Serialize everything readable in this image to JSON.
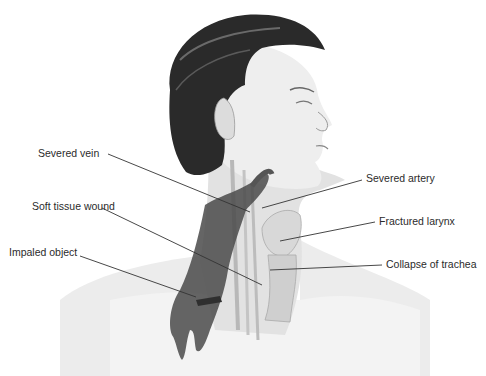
{
  "figure": {
    "labels": [
      {
        "id": "severed-vein",
        "text": "Severed vein",
        "x": 38,
        "y": 147
      },
      {
        "id": "soft-tissue-wound",
        "text": "Soft tissue wound",
        "x": 32,
        "y": 200
      },
      {
        "id": "impaled-object",
        "text": "Impaled object",
        "x": 9,
        "y": 246
      },
      {
        "id": "severed-artery",
        "text": "Severed artery",
        "x": 366,
        "y": 172
      },
      {
        "id": "fractured-larynx",
        "text": "Fractured larynx",
        "x": 379,
        "y": 215
      },
      {
        "id": "collapse-of-trachea",
        "text": "Collapse of trachea",
        "x": 386,
        "y": 258
      }
    ],
    "leader_lines": [
      {
        "from": [
          108,
          154
        ],
        "to": [
          250,
          212
        ]
      },
      {
        "from": [
          102,
          208
        ],
        "to": [
          262,
          285
        ]
      },
      {
        "from": [
          80,
          256
        ],
        "to": [
          196,
          297
        ]
      },
      {
        "from": [
          362,
          180
        ],
        "to": [
          262,
          208
        ]
      },
      {
        "from": [
          375,
          222
        ],
        "to": [
          280,
          241
        ]
      },
      {
        "from": [
          382,
          265
        ],
        "to": [
          270,
          270
        ]
      }
    ],
    "colors": {
      "hair": "#2a2a2a",
      "skin": "#eeeeee",
      "skin_shadow": "#c9c9c9",
      "blood": "#4a4a4a",
      "line": "#333333",
      "text": "#2b2b2b"
    }
  }
}
